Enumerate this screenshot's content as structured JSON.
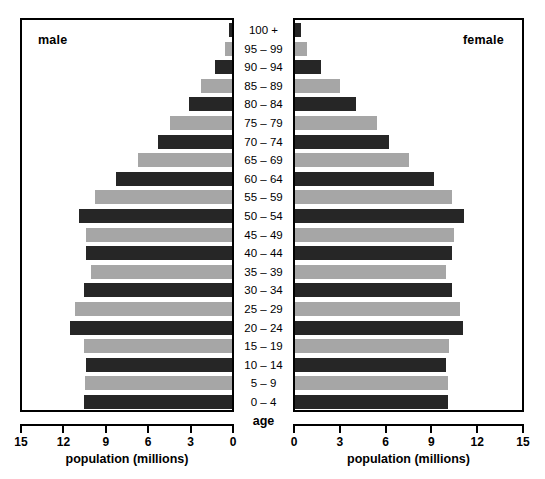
{
  "panels": {
    "male": {
      "title": "male",
      "axis_caption": "population (millions)"
    },
    "female": {
      "title": "female",
      "axis_caption": "population (millions)"
    }
  },
  "age_axis_caption": "age",
  "axis": {
    "male_ticks": [
      "15",
      "12",
      "9",
      "6",
      "3",
      "0"
    ],
    "female_ticks": [
      "0",
      "3",
      "6",
      "9",
      "12",
      "15"
    ]
  },
  "colors": {
    "dark_bar": "#262626",
    "gray_bar": "#a6a6a6",
    "frame": "#000000",
    "background": "#ffffff"
  },
  "chart_data": {
    "type": "bar",
    "title": "",
    "subtitle": "",
    "xlabel": "population (millions)",
    "ylabel": "age",
    "xlim": [
      0,
      15
    ],
    "grid": false,
    "legend": [
      "male",
      "female"
    ],
    "legend_position": "in-panel-corner",
    "orientation": "horizontal-pyramid",
    "categories": [
      "100 +",
      "95 – 99",
      "90 – 94",
      "85 – 89",
      "80 – 84",
      "75 – 79",
      "70 – 74",
      "65 – 69",
      "60 – 64",
      "55 – 59",
      "50 – 54",
      "45 – 49",
      "40 – 44",
      "35 – 39",
      "30 – 34",
      "25 – 29",
      "20 – 24",
      "15 – 19",
      "10 – 14",
      "5 – 9",
      "0 – 4"
    ],
    "category_colors": [
      "dark",
      "gray",
      "dark",
      "gray",
      "dark",
      "gray",
      "dark",
      "gray",
      "dark",
      "gray",
      "dark",
      "gray",
      "dark",
      "gray",
      "dark",
      "gray",
      "dark",
      "gray",
      "dark",
      "gray",
      "dark"
    ],
    "series": [
      {
        "name": "male",
        "direction": "left",
        "values": [
          0.2,
          0.5,
          1.2,
          2.2,
          3.1,
          4.4,
          5.3,
          6.7,
          8.3,
          9.8,
          10.9,
          10.4,
          10.4,
          10.1,
          10.6,
          11.2,
          11.6,
          10.6,
          10.4,
          10.5,
          10.6
        ]
      },
      {
        "name": "female",
        "direction": "right",
        "values": [
          0.4,
          0.8,
          1.7,
          3.0,
          4.0,
          5.4,
          6.2,
          7.5,
          9.2,
          10.4,
          11.2,
          10.5,
          10.4,
          10.0,
          10.4,
          10.9,
          11.1,
          10.2,
          10.0,
          10.1,
          10.1
        ]
      }
    ]
  }
}
